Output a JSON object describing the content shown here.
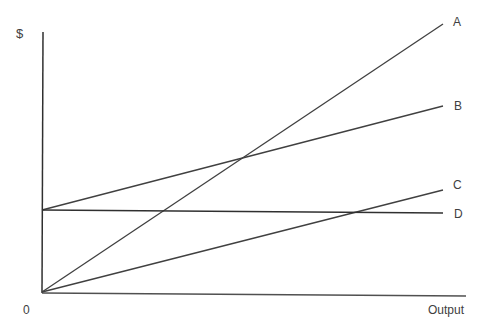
{
  "axes": {
    "y_label": "$",
    "x_label": "Output",
    "origin_label": "0"
  },
  "colors": {
    "line": "#404040",
    "axis": "#303030",
    "text": "#404040"
  },
  "lines": [
    {
      "name": "A",
      "label": "A",
      "x1": 42,
      "y1": 292,
      "x2": 443,
      "y2": 24
    },
    {
      "name": "B",
      "label": "B",
      "x1": 42,
      "y1": 210,
      "x2": 443,
      "y2": 106
    },
    {
      "name": "C",
      "label": "C",
      "x1": 42,
      "y1": 292,
      "x2": 443,
      "y2": 190
    },
    {
      "name": "D",
      "label": "D",
      "x1": 42,
      "y1": 210,
      "x2": 443,
      "y2": 213
    }
  ]
}
